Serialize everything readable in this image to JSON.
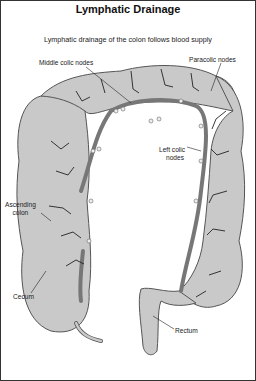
{
  "title": "Lymphatic Drainage",
  "subtitle": "Lymphatic drainage of the colon follows blood supply",
  "labels": {
    "middle_colic": "Middle colic nodes",
    "paracolic": "Paracolic nodes",
    "left_colic_1": "Left colic",
    "left_colic_2": "nodes",
    "ascending_1": "Ascending",
    "ascending_2": "colon",
    "cecum": "Cecum",
    "rectum": "Rectum"
  },
  "colors": {
    "colon_fill": "#c9c9c9",
    "colon_stroke": "#555555",
    "vessel": "#777777",
    "branch": "#222222",
    "node": "#eeeeee"
  }
}
